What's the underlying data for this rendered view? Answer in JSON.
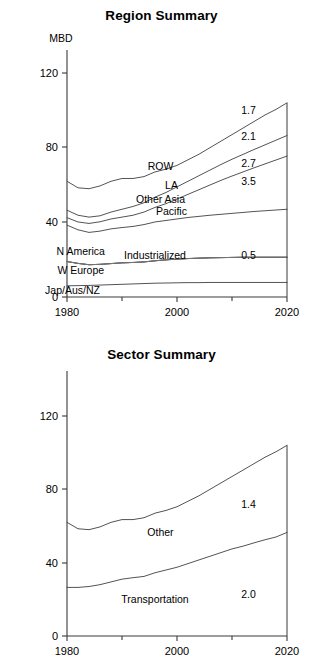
{
  "chart_data": [
    {
      "type": "area",
      "id": "region-summary",
      "title": "Region Summary",
      "xlabel": "",
      "ylabel": "MBD",
      "unit_label": "MBD",
      "x": [
        1980,
        1982,
        1984,
        1986,
        1988,
        1990,
        1992,
        1994,
        1996,
        1998,
        2000,
        2002,
        2004,
        2006,
        2008,
        2010,
        2012,
        2014,
        2016,
        2018,
        2020
      ],
      "xlim": [
        1980,
        2020
      ],
      "ylim": [
        0,
        130
      ],
      "xticks": [
        1980,
        2000,
        2020
      ],
      "xticklabels": [
        "1980",
        "2000",
        "2020"
      ],
      "xminorticks": [
        1990,
        2010
      ],
      "yticks": [
        0,
        40,
        80,
        120
      ],
      "yticklabels": [
        "0",
        "40",
        "80",
        "120"
      ],
      "grid": false,
      "legend_position": "inline-band-labels",
      "stacking": "cumulative-top-lines",
      "series": [
        {
          "name": "Jap/Aus/NZ",
          "label": "Jap/Aus/NZ",
          "annotation": "",
          "values": [
            6.0,
            6.1,
            6.2,
            6.4,
            6.6,
            6.8,
            7.0,
            7.2,
            7.4,
            7.5,
            7.6,
            7.7,
            7.7,
            7.8,
            7.8,
            7.8,
            7.8,
            7.8,
            7.8,
            7.8,
            7.8
          ]
        },
        {
          "name": "W Europe",
          "label": "W Europe",
          "annotation": "",
          "values": [
            19.0,
            18.0,
            17.3,
            17.5,
            17.9,
            18.3,
            18.5,
            18.8,
            19.4,
            19.9,
            20.3,
            20.6,
            20.8,
            21.0,
            21.1,
            21.2,
            21.3,
            21.3,
            21.3,
            21.3,
            21.3
          ]
        },
        {
          "name": "N America",
          "label": "N America",
          "annotation": "",
          "values": [
            19.0,
            18.0,
            17.3,
            17.5,
            17.9,
            18.3,
            18.5,
            18.8,
            19.4,
            19.9,
            20.3,
            20.6,
            20.8,
            21.0,
            21.1,
            21.2,
            21.3,
            21.3,
            21.3,
            21.3,
            21.3
          ]
        },
        {
          "name": "Industrialized",
          "label": "Industrialized",
          "annotation": "0.5",
          "values": [
            19.0,
            18.0,
            17.3,
            17.5,
            17.9,
            18.3,
            18.5,
            18.8,
            19.4,
            19.9,
            20.3,
            20.6,
            20.8,
            21.0,
            21.1,
            21.2,
            21.3,
            21.3,
            21.3,
            21.3,
            21.3
          ]
        },
        {
          "name": "Pacific",
          "label": "Pacific",
          "annotation": "3.5",
          "values": [
            38.5,
            36.0,
            34.6,
            35.3,
            36.5,
            37.2,
            37.8,
            38.8,
            40.2,
            41.0,
            41.8,
            42.6,
            43.2,
            43.8,
            44.3,
            44.8,
            45.3,
            45.8,
            46.2,
            46.6,
            47.0
          ]
        },
        {
          "name": "Other Asia",
          "label": "Other Asia",
          "annotation": "2.7",
          "values": [
            42.5,
            40.2,
            39.4,
            40.3,
            41.8,
            42.8,
            43.8,
            45.5,
            48.0,
            50.0,
            52.5,
            55.0,
            57.5,
            60.0,
            62.5,
            64.8,
            67.0,
            69.2,
            71.3,
            73.4,
            75.5
          ]
        },
        {
          "name": "LA",
          "label": "LA",
          "annotation": "2.1",
          "values": [
            46.5,
            43.8,
            42.8,
            43.5,
            45.5,
            47.0,
            48.5,
            50.5,
            53.5,
            56.0,
            59.0,
            62.0,
            65.0,
            68.0,
            71.0,
            73.8,
            76.4,
            79.0,
            81.5,
            84.0,
            86.5
          ]
        },
        {
          "name": "ROW",
          "label": "ROW",
          "annotation": "1.7",
          "values": [
            62.0,
            58.5,
            58.0,
            59.5,
            62.0,
            63.5,
            63.5,
            64.5,
            67.0,
            68.5,
            70.5,
            73.5,
            76.5,
            80.0,
            83.5,
            87.0,
            90.5,
            94.0,
            97.5,
            100.5,
            104.0
          ]
        }
      ],
      "band_labels": [
        {
          "text": "ROW",
          "x": 1997,
          "y": 70
        },
        {
          "text": "LA",
          "x": 1999,
          "y": 60
        },
        {
          "text": "Other Asia",
          "x": 1997,
          "y": 52.5
        },
        {
          "text": "Pacific",
          "x": 1999,
          "y": 46
        },
        {
          "text": "N America",
          "x": 1982.5,
          "y": 24.5
        },
        {
          "text": "Industrialized",
          "x": 1996,
          "y": 22.5
        },
        {
          "text": "W Europe",
          "x": 1982.5,
          "y": 14.5
        },
        {
          "text": "Jap/Aus/NZ",
          "x": 1981,
          "y": 4.0
        }
      ],
      "annotations": [
        {
          "text": "1.7",
          "x": 2013,
          "y": 100
        },
        {
          "text": "2.1",
          "x": 2013,
          "y": 86
        },
        {
          "text": "2.7",
          "x": 2013,
          "y": 72
        },
        {
          "text": "3.5",
          "x": 2013,
          "y": 62
        },
        {
          "text": "0.5",
          "x": 2013,
          "y": 22.5
        }
      ]
    },
    {
      "type": "area",
      "id": "sector-summary",
      "title": "Sector Summary",
      "xlabel": "",
      "ylabel": "",
      "unit_label": "",
      "x": [
        1980,
        1982,
        1984,
        1986,
        1988,
        1990,
        1992,
        1994,
        1996,
        1998,
        2000,
        2002,
        2004,
        2006,
        2008,
        2010,
        2012,
        2014,
        2016,
        2018,
        2020
      ],
      "xlim": [
        1980,
        2020
      ],
      "ylim": [
        0,
        130
      ],
      "xticks": [
        1980,
        2000,
        2020
      ],
      "xticklabels": [
        "1980",
        "2000",
        "2020"
      ],
      "xminorticks": [
        1990,
        2010
      ],
      "yticks": [
        0,
        40,
        80,
        120
      ],
      "yticklabels": [
        "0",
        "40",
        "80",
        "120"
      ],
      "grid": false,
      "legend_position": "inline-band-labels",
      "stacking": "cumulative-top-lines",
      "series": [
        {
          "name": "Transportation",
          "label": "Transportation",
          "annotation": "2.0",
          "values": [
            26.5,
            26.5,
            27.0,
            28.0,
            29.5,
            31.0,
            31.8,
            32.5,
            34.5,
            36.0,
            37.5,
            39.5,
            41.5,
            43.5,
            45.5,
            47.5,
            49.0,
            50.8,
            52.5,
            54.0,
            56.5
          ]
        },
        {
          "name": "Other",
          "label": "Other",
          "annotation": "1.4",
          "values": [
            62.0,
            58.5,
            58.0,
            59.5,
            62.0,
            63.5,
            63.5,
            64.5,
            67.0,
            68.5,
            70.5,
            73.5,
            76.5,
            80.0,
            83.5,
            87.0,
            90.5,
            94.0,
            97.5,
            100.5,
            104.0
          ]
        }
      ],
      "band_labels": [
        {
          "text": "Other",
          "x": 1997,
          "y": 57
        },
        {
          "text": "Transportation",
          "x": 1996,
          "y": 20
        }
      ],
      "annotations": [
        {
          "text": "1.4",
          "x": 2013,
          "y": 72
        },
        {
          "text": "2.0",
          "x": 2013,
          "y": 23
        }
      ]
    }
  ],
  "figures": {
    "region": {
      "title": "Region Summary",
      "unit_label": "MBD"
    },
    "sector": {
      "title": "Sector Summary"
    }
  },
  "colors": {
    "background": "#ffffff",
    "axis": "#3a3a3a",
    "line": "#4a4a4a",
    "flat_line": "#777777",
    "text": "#000000"
  }
}
